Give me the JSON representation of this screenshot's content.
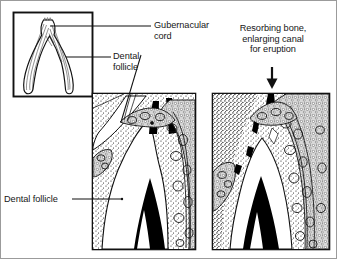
{
  "figure": {
    "background_color": "#ffffff",
    "ink_color": "#111111",
    "frame_color": "#9b9b9b"
  },
  "labels": {
    "gubernacular_cord": "Gubernacular\ncord",
    "dental_follicle_inset": "Dental\nfollicle",
    "resorbing_bone": "Resorbing bone,\nenlarging canal\nfor eruption",
    "dental_follicle_panel": "Dental follicle"
  },
  "icons": {
    "down_arrow": "down-arrow-icon",
    "leader_line": "leader-line-icon"
  },
  "panels": [
    {
      "id": "inset",
      "name": "gubernacular-cord-inset",
      "caption": "",
      "x": 13,
      "y": 12,
      "w": 80,
      "h": 85,
      "contents": [
        "gubernacular cord",
        "dental follicle",
        "wishbone-shaped soft tissue strand"
      ]
    },
    {
      "id": "left-panel",
      "name": "pre-eruption-histology-panel",
      "caption": "",
      "x": 92,
      "y": 93,
      "w": 104,
      "h": 157,
      "contents": [
        "unerupted tooth crown",
        "dental follicle",
        "trabecular alveolar bone",
        "gubernacular canal"
      ]
    },
    {
      "id": "right-panel",
      "name": "eruption-histology-panel",
      "caption": "",
      "x": 212,
      "y": 93,
      "w": 118,
      "h": 157,
      "contents": [
        "erupting tooth crown",
        "resorbing bone",
        "enlarged eruption canal",
        "osteoclastic resorption foci"
      ]
    }
  ],
  "annotations": {
    "resorption_markers": 3,
    "arrow_direction": "down"
  }
}
